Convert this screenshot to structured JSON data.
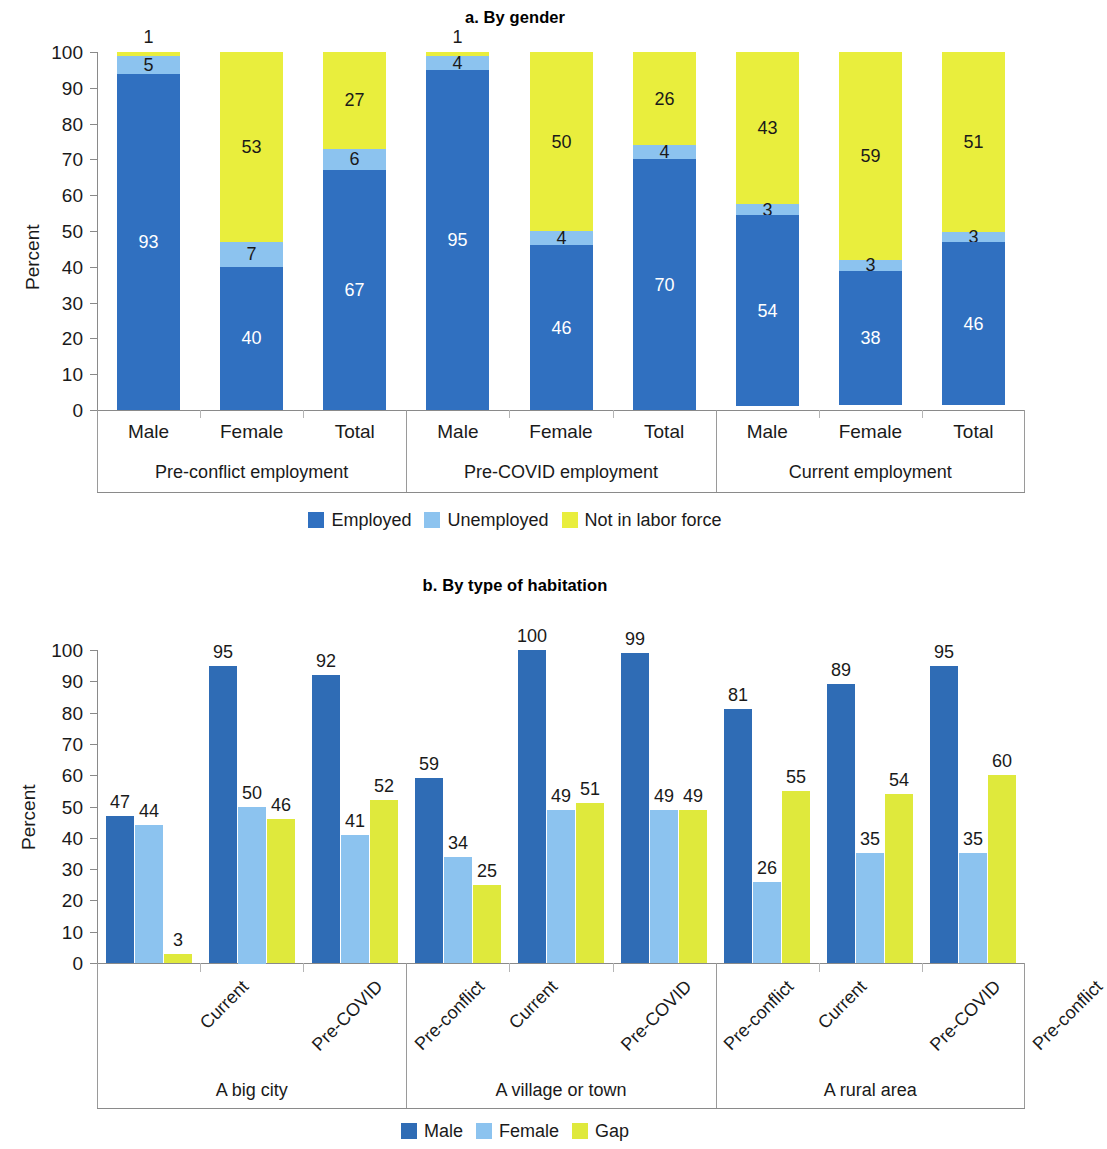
{
  "panel_a": {
    "title": "a. By gender",
    "ylabel": "Percent",
    "legend": [
      {
        "label": "Employed",
        "color": "#3070c0"
      },
      {
        "label": "Unemployed",
        "color": "#8cc3ef"
      },
      {
        "label": "Not in labor force",
        "color": "#e9ee3d"
      }
    ],
    "yticks": [
      "0",
      "10",
      "20",
      "30",
      "40",
      "50",
      "60",
      "70",
      "80",
      "90",
      "100"
    ],
    "categories": [
      "Male",
      "Female",
      "Total",
      "Male",
      "Female",
      "Total",
      "Male",
      "Female",
      "Total"
    ],
    "groups": [
      "Pre-conflict employment",
      "Pre-COVID employment",
      "Current employment"
    ]
  },
  "panel_b": {
    "title": "b. By type of habitation",
    "ylabel": "Percent",
    "legend": [
      {
        "label": "Male",
        "color": "#2f6cb5"
      },
      {
        "label": "Female",
        "color": "#8cc3ef"
      },
      {
        "label": "Gap",
        "color": "#dfe93c"
      }
    ],
    "yticks": [
      "0",
      "10",
      "20",
      "30",
      "40",
      "50",
      "60",
      "70",
      "80",
      "90",
      "100"
    ],
    "categories": [
      "Current",
      "Pre-COVID",
      "Pre-conflict",
      "Current",
      "Pre-COVID",
      "Pre-conflict",
      "Current",
      "Pre-COVID",
      "Pre-conflict"
    ],
    "groups": [
      "A big city",
      "A village or town",
      "A rural area"
    ]
  },
  "chart_data": [
    {
      "type": "bar",
      "subtype": "stacked-100",
      "title": "a. By gender",
      "xlabel": "",
      "ylabel": "Percent",
      "ylim": [
        0,
        100
      ],
      "ytick_step": 10,
      "grid": false,
      "legend_position": "bottom",
      "group_labels": [
        "Pre-conflict employment",
        "Pre-COVID employment",
        "Current employment"
      ],
      "categories": [
        "Male",
        "Female",
        "Total",
        "Male",
        "Female",
        "Total",
        "Male",
        "Female",
        "Total"
      ],
      "series": [
        {
          "name": "Employed",
          "color": "#3070c0",
          "values": [
            93,
            40,
            67,
            95,
            46,
            70,
            54,
            38,
            46
          ]
        },
        {
          "name": "Unemployed",
          "color": "#8cc3ef",
          "values": [
            5,
            7,
            6,
            4,
            4,
            4,
            3,
            3,
            3
          ]
        },
        {
          "name": "Not in labor force",
          "color": "#e9ee3d",
          "values": [
            1,
            53,
            27,
            1,
            50,
            26,
            43,
            59,
            51
          ]
        }
      ],
      "annotations": [
        {
          "category": "Male",
          "group": "Pre-conflict employment",
          "series": "Not in labor force",
          "text": "1",
          "placement": "above-bar"
        },
        {
          "category": "Male",
          "group": "Pre-COVID employment",
          "series": "Not in labor force",
          "text": "1",
          "placement": "above-bar"
        }
      ]
    },
    {
      "type": "bar",
      "subtype": "grouped",
      "title": "b. By type of habitation",
      "xlabel": "",
      "ylabel": "Percent",
      "ylim": [
        0,
        100
      ],
      "ytick_step": 10,
      "grid": false,
      "legend_position": "bottom",
      "group_labels": [
        "A big city",
        "A village or town",
        "A rural area"
      ],
      "categories": [
        "Current",
        "Pre-COVID",
        "Pre-conflict",
        "Current",
        "Pre-COVID",
        "Pre-conflict",
        "Current",
        "Pre-COVID",
        "Pre-conflict"
      ],
      "series": [
        {
          "name": "Male",
          "color": "#2f6cb5",
          "values": [
            47,
            95,
            92,
            59,
            100,
            99,
            81,
            89,
            95
          ]
        },
        {
          "name": "Female",
          "color": "#8cc3ef",
          "values": [
            44,
            50,
            41,
            34,
            49,
            49,
            26,
            35,
            35
          ]
        },
        {
          "name": "Gap",
          "color": "#dfe93c",
          "values": [
            3,
            46,
            52,
            25,
            51,
            49,
            55,
            54,
            60
          ]
        }
      ]
    }
  ]
}
